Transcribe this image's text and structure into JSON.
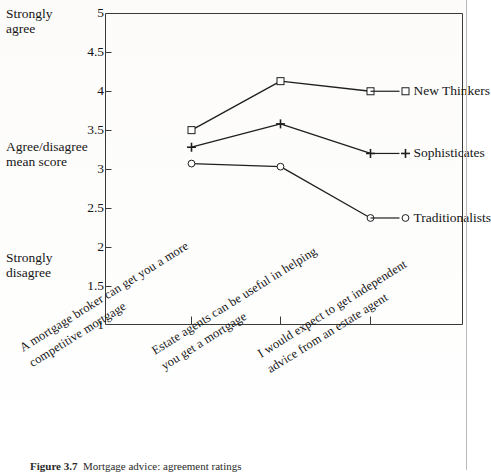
{
  "figure": {
    "caption_number": "Figure 3.7",
    "caption_body": "Mortgage advice: agreement ratings"
  },
  "axes": {
    "y_axis_title_top": "Strongly\nagree",
    "y_axis_title_middle": "Agree/disagree\nmean score",
    "y_axis_title_bottom": "Strongly\ndisagree",
    "y_ticks": [
      "5",
      "4.5",
      "4",
      "3.5",
      "3",
      "2.5",
      "2",
      "1.5",
      "1"
    ]
  },
  "series_labels": {
    "new_thinkers": "New Thinkers",
    "sophisticates": "Sophisticates",
    "traditionalists": "Traditionalists"
  },
  "categories_display": [
    "A mortgage broker can get you a more\ncompetitive mortgage",
    "Estate agents can be useful in helping\nyou get a mortgage",
    "I would expect to get independent\nadvice from an estate agent"
  ],
  "colors": {
    "line": "#1f1f1f",
    "frame": "#3a3a3a",
    "text": "#151515",
    "background": "#ffffff"
  },
  "chart_data": {
    "type": "line",
    "title": "",
    "xlabel": "",
    "ylabel": "Agree/disagree mean score",
    "ylim": [
      1,
      5
    ],
    "ytick_step": 0.5,
    "grid": false,
    "legend_position": "inline-right",
    "categories": [
      "A mortgage broker can get you a more competitive mortgage",
      "Estate agents can be useful in helping you get a mortgage",
      "I would expect to get independent advice from an estate agent"
    ],
    "series": [
      {
        "name": "New Thinkers",
        "marker": "square",
        "values": [
          3.5,
          4.13,
          4.0
        ]
      },
      {
        "name": "Sophisticates",
        "marker": "plus",
        "values": [
          3.28,
          3.58,
          3.2
        ]
      },
      {
        "name": "Traditionalists",
        "marker": "circle",
        "values": [
          3.07,
          3.03,
          2.37
        ]
      }
    ]
  }
}
